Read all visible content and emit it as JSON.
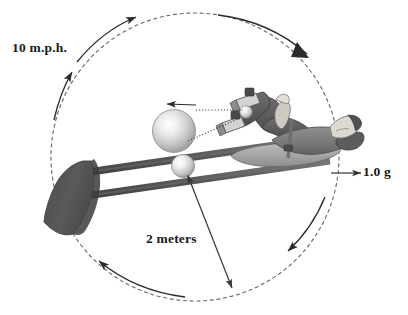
{
  "figure": {
    "type": "technical-illustration",
    "background_color": "#ffffff",
    "ink_color": "#1a1a1a"
  },
  "annotations": {
    "speed": "10 m.p.h.",
    "radius": "2 meters",
    "acceleration": "1.0 g"
  },
  "elements": {
    "rotation_path": {
      "name": "dashed-circle",
      "center_x": 195,
      "center_y": 157,
      "radius": 144,
      "style": "dashed",
      "color": "#6e6e6e"
    },
    "rotation_arrows": {
      "count": 4,
      "direction": "clockwise",
      "color": "#2a2a2a"
    },
    "arm": {
      "name": "rotating-arm",
      "color": "#5a5a5a",
      "rod_count": 2
    },
    "counterweight": {
      "name": "counterweight-paddle",
      "color": "#565656"
    },
    "hub_sphere_large": {
      "name": "large-sphere",
      "cx": 174,
      "cy": 131,
      "r": 21,
      "color": "#c9c9c9",
      "highlight": "#f2f2f2"
    },
    "hub_sphere_small": {
      "name": "small-sphere",
      "cx": 182,
      "cy": 166,
      "r": 11,
      "color": "#cdcdcd",
      "highlight": "#f4f4f4"
    },
    "rider": {
      "name": "reclined-person",
      "posture": "supine, knees bent, feet on pedals",
      "suit_color": "#5f5f5f",
      "skin_color": "#d9d6cf"
    },
    "velocity_arrow": {
      "name": "tangential-velocity-arrow",
      "direction": "left",
      "color": "#2a2a2a"
    },
    "radius_arrow": {
      "name": "radius-double-arrow",
      "color": "#3a3a3a"
    },
    "g_arrow": {
      "name": "g-force-arrow",
      "direction": "right",
      "color": "#3a3a3a"
    },
    "sight_lines": {
      "name": "dotted-sight-lines",
      "color": "#3a3a3a",
      "style": "dotted"
    }
  }
}
